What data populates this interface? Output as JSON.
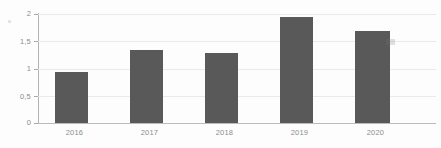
{
  "chart_data": {
    "type": "bar",
    "title": "",
    "subtitle": "",
    "xlabel": "",
    "ylabel": "",
    "categories": [
      "2016",
      "2017",
      "2018",
      "2019",
      "2020"
    ],
    "values": [
      0.9,
      1.29,
      1.24,
      1.88,
      1.62
    ],
    "series": [
      {
        "name": "",
        "values": [
          0.9,
          1.29,
          1.24,
          1.88,
          1.62
        ]
      }
    ],
    "ylim": [
      0,
      2
    ],
    "y_ticks": [
      0,
      0.5,
      1,
      1.5,
      2
    ],
    "y_tick_labels": [
      "0",
      "0,5",
      "1",
      "1,5",
      "2"
    ],
    "x_tick_labels": [
      "2016",
      "2017",
      "2018",
      "2019",
      "2020"
    ],
    "decimal_separator": ",",
    "grid": true,
    "grid_axis": "y",
    "legend": false,
    "legend_position": "none",
    "annotations": [],
    "colors": {
      "bar_fill": "#595959",
      "gridline": "#e9eaec",
      "axis_line": "#b0b2b4",
      "baseline": "#b9bbbd",
      "tick_label": "#8b8d8f",
      "background": "#fdfdfd"
    }
  }
}
